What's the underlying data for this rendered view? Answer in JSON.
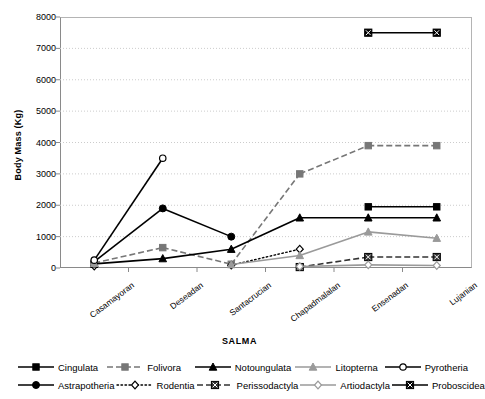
{
  "chart_data": {
    "type": "line",
    "title": "",
    "xlabel": "SALMA",
    "ylabel": "Body Mass (Kg)",
    "categories": [
      "Casamayoran",
      "Deseadan",
      "Santacrucian",
      "Chapadmalalan",
      "Ensenadan",
      "Lujanian"
    ],
    "ylim": [
      0,
      8000
    ],
    "yticks": [
      "0",
      "1000",
      "2000",
      "3000",
      "4000",
      "5000",
      "6000",
      "7000",
      "8000"
    ],
    "grid": "horizontal-dotted",
    "legend_position": "bottom",
    "series": [
      {
        "name": "Cingulata",
        "marker": "filled-square",
        "line": "solid",
        "color": "#000000",
        "values": [
          120,
          null,
          null,
          null,
          1950,
          1950
        ]
      },
      {
        "name": "Astrapotheria",
        "marker": "filled-circle",
        "line": "solid",
        "color": "#000000",
        "values": [
          200,
          1900,
          1000,
          null,
          null,
          null
        ]
      },
      {
        "name": "Folivora",
        "marker": "filled-square",
        "line": "dashed",
        "color": "#777777",
        "values": [
          160,
          650,
          120,
          3000,
          3900,
          3900
        ]
      },
      {
        "name": "Rodentia",
        "marker": "open-diamond",
        "line": "dotted",
        "color": "#000000",
        "values": [
          60,
          null,
          90,
          600,
          null,
          null
        ]
      },
      {
        "name": "Notoungulata",
        "marker": "filled-triangle",
        "line": "solid",
        "color": "#000000",
        "values": [
          130,
          300,
          600,
          1600,
          1600,
          1600
        ]
      },
      {
        "name": "Perissodactyla",
        "marker": "boxed-x",
        "line": "dashed",
        "color": "#333333",
        "values": [
          null,
          null,
          null,
          30,
          350,
          350
        ]
      },
      {
        "name": "Litopterna",
        "marker": "filled-triangle",
        "line": "solid",
        "color": "#9a9a9a",
        "values": [
          150,
          null,
          110,
          400,
          1150,
          950
        ]
      },
      {
        "name": "Artiodactyla",
        "marker": "open-diamond",
        "line": "solid",
        "color": "#9a9a9a",
        "values": [
          null,
          null,
          null,
          50,
          100,
          80
        ]
      },
      {
        "name": "Pyrotheria",
        "marker": "open-circle",
        "line": "solid",
        "color": "#000000",
        "values": [
          250,
          3500,
          null,
          null,
          null,
          null
        ]
      },
      {
        "name": "Proboscidea",
        "marker": "boxed-x",
        "line": "solid",
        "color": "#000000",
        "values": [
          null,
          null,
          null,
          null,
          7500,
          7500
        ]
      }
    ]
  },
  "axes": {
    "y_title": "Body Mass (Kg)",
    "x_title": "SALMA"
  },
  "legend": {
    "rows": [
      [
        {
          "label": "Cingulata",
          "series": 0
        },
        {
          "label": "Folivora",
          "series": 2
        },
        {
          "label": "Notoungulata",
          "series": 4
        },
        {
          "label": "Litopterna",
          "series": 6
        },
        {
          "label": "Pyrotheria",
          "series": 8
        }
      ],
      [
        {
          "label": "Astrapotheria",
          "series": 1
        },
        {
          "label": "Rodentia",
          "series": 3
        },
        {
          "label": "Perissodactyla",
          "series": 5
        },
        {
          "label": "Artiodactyla",
          "series": 7
        },
        {
          "label": "Proboscidea",
          "series": 9
        }
      ]
    ]
  },
  "colors": {
    "axis": "#8a8a8a",
    "grid": "#cccccc",
    "dark": "#000000",
    "mid": "#777777",
    "light": "#9a9a9a"
  }
}
